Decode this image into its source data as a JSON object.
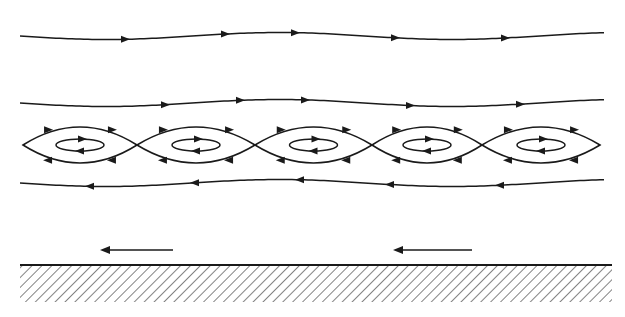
{
  "diagram": {
    "type": "streamline-flow",
    "stroke_color": "#1a1a1a",
    "background": "#ffffff",
    "streamlines_upper": [
      {
        "y": 36,
        "direction": "right",
        "arrows_x": [
          125,
          225,
          295,
          395,
          505
        ]
      },
      {
        "y": 103,
        "direction": "right",
        "arrows_x": [
          165,
          240,
          305,
          410,
          520
        ]
      }
    ],
    "cat_eyes": {
      "center_y": 145,
      "half_height": 18,
      "cells": [
        {
          "x0": 23,
          "x1": 137
        },
        {
          "x0": 137,
          "x1": 255
        },
        {
          "x0": 255,
          "x1": 372
        },
        {
          "x0": 372,
          "x1": 482
        },
        {
          "x0": 482,
          "x1": 600
        }
      ],
      "inner_orbit_rx": 24,
      "inner_orbit_ry": 6
    },
    "streamlines_lower": [
      {
        "y": 183,
        "direction": "left",
        "arrows_x": [
          90,
          195,
          300,
          390,
          500
        ]
      }
    ],
    "wall_arrows": [
      {
        "x_from": 173,
        "x_to": 100,
        "y": 250,
        "direction": "left"
      },
      {
        "x_from": 472,
        "x_to": 393,
        "y": 250,
        "direction": "left"
      }
    ],
    "wall": {
      "y": 265,
      "x0": 20,
      "x1": 612,
      "hatch_depth": 37
    }
  }
}
